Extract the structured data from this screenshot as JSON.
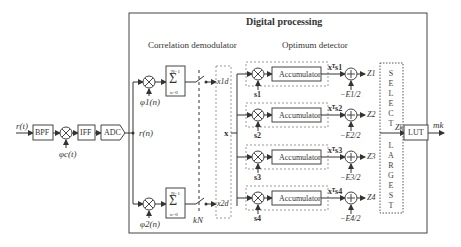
{
  "title": "Digital processing",
  "sections": {
    "correlation": "Correlation demodulator",
    "optimum": "Optimum detector"
  },
  "front_end": {
    "input": "r(t)",
    "bpf": "BPF",
    "lo": "φc(t)",
    "iff": "IFF",
    "adc": "ADC",
    "output": "r(n)"
  },
  "demod": {
    "phi1": "φ1(n)",
    "phi2": "φ2(n)",
    "sum_top": "N−1",
    "sum_bot": "n=0",
    "sum_symbol": "Σ",
    "sample": "kN",
    "x1": "x1d",
    "x2": "x2d",
    "vector": "x"
  },
  "detector": {
    "branches": [
      {
        "s": "s1",
        "acc": "Accumulator",
        "prod": "xᵀs1",
        "bias": "−E1/2",
        "z": "Z1"
      },
      {
        "s": "s2",
        "acc": "Accumulator",
        "prod": "xᵀs2",
        "bias": "−E2/2",
        "z": "Z2"
      },
      {
        "s": "s3",
        "acc": "Accumulator",
        "prod": "xᵀs3",
        "bias": "−E3/2",
        "z": "Z3"
      },
      {
        "s": "s4",
        "acc": "Accumulator",
        "prod": "xᵀs4",
        "bias": "−E4/2",
        "z": "Z4"
      }
    ]
  },
  "select": {
    "letters": [
      "S",
      "E",
      "L",
      "E",
      "C",
      "T",
      "",
      "L",
      "A",
      "R",
      "G",
      "E",
      "S",
      "T"
    ],
    "output": "Zk"
  },
  "lut": {
    "label": "LUT",
    "output": "mk"
  }
}
